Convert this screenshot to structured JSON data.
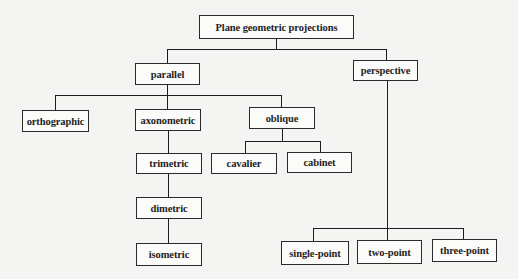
{
  "diagram": {
    "title": "Plane geometric projections",
    "nodes": {
      "root": "Plane geometric projections",
      "parallel": "parallel",
      "perspective": "perspective",
      "orthographic": "orthographic",
      "axonometric": "axonometric",
      "oblique": "oblique",
      "trimetric": "trimetric",
      "dimetric": "dimetric",
      "isometric": "isometric",
      "cavalier": "cavalier",
      "cabinet": "cabinet",
      "single_point": "single-point",
      "two_point": "two-point",
      "three_point": "three-point"
    },
    "edges": [
      [
        "root",
        "parallel"
      ],
      [
        "root",
        "perspective"
      ],
      [
        "parallel",
        "orthographic"
      ],
      [
        "parallel",
        "axonometric"
      ],
      [
        "parallel",
        "oblique"
      ],
      [
        "axonometric",
        "trimetric"
      ],
      [
        "trimetric",
        "dimetric"
      ],
      [
        "dimetric",
        "isometric"
      ],
      [
        "oblique",
        "cavalier"
      ],
      [
        "oblique",
        "cabinet"
      ],
      [
        "perspective",
        "single_point"
      ],
      [
        "perspective",
        "two_point"
      ],
      [
        "perspective",
        "three_point"
      ]
    ]
  }
}
